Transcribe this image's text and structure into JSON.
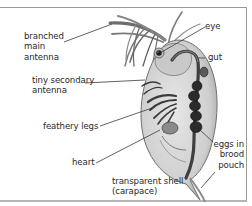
{
  "diagram": {
    "labels": [
      {
        "id": "branched-main-antenna",
        "text": "branched\nmain\nantenna"
      },
      {
        "id": "tiny-secondary-antenna",
        "text": "tiny secondary\nantenna"
      },
      {
        "id": "feathery-legs",
        "text": "feathery legs"
      },
      {
        "id": "heart",
        "text": "heart"
      },
      {
        "id": "transparent-shell",
        "text": "transparent shell\n(carapace)"
      },
      {
        "id": "eye",
        "text": "eye"
      },
      {
        "id": "gut",
        "text": "gut"
      },
      {
        "id": "eggs-in-brood-pouch",
        "text": "eggs in\nbrood\npouch"
      }
    ]
  },
  "colors": {
    "frame": "#9a9a9a",
    "text": "#2a2a2a",
    "leader_line": "#3a3a3a",
    "body_fill": "#d6d6d6",
    "dark_organs": "#2b2b2b"
  }
}
